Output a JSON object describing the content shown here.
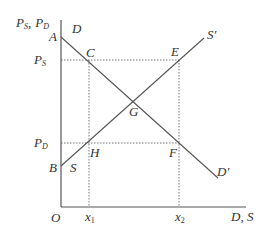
{
  "diagram": {
    "type": "supply-demand",
    "axes": {
      "y_label_main": "P",
      "y_label_sub1": "S",
      "y_label_sep": ",",
      "y_label_sub2": "D",
      "x_label": "D, S",
      "origin": "O"
    },
    "price_labels": {
      "ps_main": "P",
      "ps_sub": "S",
      "pd_main": "P",
      "pd_sub": "D"
    },
    "quantity_labels": {
      "x1_main": "x",
      "x1_sub": "1",
      "x2_main": "x",
      "x2_sub": "2"
    },
    "curves": {
      "demand_start": "D",
      "demand_end": "D′",
      "supply_start": "S",
      "supply_end": "S′"
    },
    "points": {
      "A": "A",
      "B": "B",
      "C": "C",
      "E": "E",
      "G": "G",
      "H": "H",
      "F": "F"
    }
  }
}
